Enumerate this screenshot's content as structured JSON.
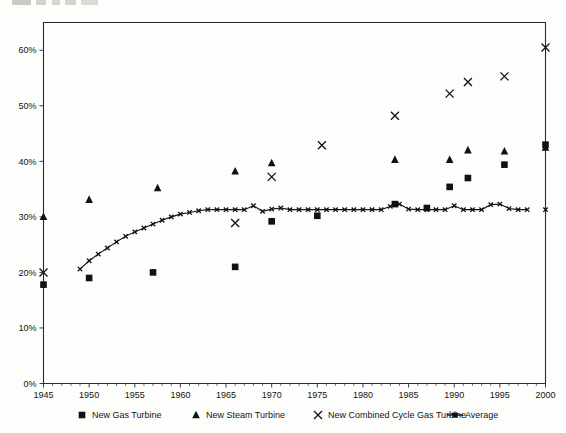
{
  "page": {
    "cut_off_header_fragment": "",
    "background_color": "#fdfdfb",
    "ink_color": "#111111"
  },
  "chart_data": {
    "type": "scatter",
    "title": "",
    "subtitle": "",
    "xlabel": "",
    "ylabel": "",
    "xlim": [
      1945,
      2000
    ],
    "ylim": [
      0,
      65
    ],
    "ytick_labels": [
      "0%",
      "10%",
      "20%",
      "30%",
      "40%",
      "50%",
      "60%"
    ],
    "ytick_values": [
      0,
      10,
      20,
      30,
      40,
      50,
      60
    ],
    "xtick_labels": [
      "1945",
      "1950",
      "1955",
      "1960",
      "1965",
      "1970",
      "1975",
      "1980",
      "1985",
      "1990",
      "1995",
      "2000"
    ],
    "xtick_values": [
      1945,
      1950,
      1955,
      1960,
      1965,
      1970,
      1975,
      1980,
      1985,
      1990,
      1995,
      2000
    ],
    "grid": false,
    "legend_position": "bottom",
    "y_unit": "percent",
    "series": [
      {
        "name": "New Gas Turbine",
        "marker": "square",
        "style": "points",
        "points": [
          [
            1945,
            17.8
          ],
          [
            1950,
            19.0
          ],
          [
            1957,
            20.0
          ],
          [
            1966,
            21.0
          ],
          [
            1970,
            29.2
          ],
          [
            1975,
            30.2
          ],
          [
            1983.5,
            32.3
          ],
          [
            1987,
            31.6
          ],
          [
            1989.5,
            35.4
          ],
          [
            1991.5,
            37.0
          ],
          [
            1995.5,
            39.4
          ],
          [
            2000,
            43.0
          ]
        ]
      },
      {
        "name": "New Steam Turbine",
        "marker": "triangle",
        "style": "points",
        "points": [
          [
            1945,
            30.0
          ],
          [
            1950,
            33.1
          ],
          [
            1957.5,
            35.2
          ],
          [
            1966,
            38.2
          ],
          [
            1970,
            39.7
          ],
          [
            1983.5,
            40.3
          ],
          [
            1989.5,
            40.3
          ],
          [
            1991.5,
            42.0
          ],
          [
            1995.5,
            41.8
          ],
          [
            2000,
            42.5
          ]
        ]
      },
      {
        "name": "New Combined Cycle Gas Turbine",
        "marker": "x",
        "style": "points",
        "points": [
          [
            1945,
            20.0
          ],
          [
            1966,
            28.9
          ],
          [
            1970,
            37.2
          ],
          [
            1975.5,
            42.9
          ],
          [
            1983.5,
            48.2
          ],
          [
            1989.5,
            52.2
          ],
          [
            1991.5,
            54.3
          ],
          [
            1995.5,
            55.3
          ],
          [
            2000,
            60.5
          ]
        ]
      },
      {
        "name": "Average",
        "marker": "x-line",
        "style": "line+points",
        "points": [
          [
            1949,
            20.6
          ],
          [
            1950,
            22.1
          ],
          [
            1951,
            23.3
          ],
          [
            1952,
            24.4
          ],
          [
            1953,
            25.5
          ],
          [
            1954,
            26.5
          ],
          [
            1955,
            27.3
          ],
          [
            1956,
            28.0
          ],
          [
            1957,
            28.7
          ],
          [
            1958,
            29.4
          ],
          [
            1959,
            30.0
          ],
          [
            1960,
            30.5
          ],
          [
            1961,
            30.8
          ],
          [
            1962,
            31.1
          ],
          [
            1963,
            31.3
          ],
          [
            1964,
            31.3
          ],
          [
            1965,
            31.3
          ],
          [
            1966,
            31.3
          ],
          [
            1967,
            31.3
          ],
          [
            1968,
            32.0
          ],
          [
            1969,
            31.0
          ],
          [
            1970,
            31.4
          ],
          [
            1971,
            31.6
          ],
          [
            1972,
            31.3
          ],
          [
            1973,
            31.3
          ],
          [
            1974,
            31.3
          ],
          [
            1975,
            31.3
          ],
          [
            1976,
            31.3
          ],
          [
            1977,
            31.3
          ],
          [
            1978,
            31.3
          ],
          [
            1979,
            31.3
          ],
          [
            1980,
            31.3
          ],
          [
            1981,
            31.3
          ],
          [
            1982,
            31.3
          ],
          [
            1983,
            31.9
          ],
          [
            1984,
            32.3
          ],
          [
            1985,
            31.4
          ],
          [
            1986,
            31.3
          ],
          [
            1987,
            31.3
          ],
          [
            1988,
            31.3
          ],
          [
            1989,
            31.3
          ],
          [
            1990,
            32.0
          ],
          [
            1991,
            31.3
          ],
          [
            1992,
            31.3
          ],
          [
            1993,
            31.3
          ],
          [
            1994,
            32.2
          ],
          [
            1995,
            32.3
          ],
          [
            1996,
            31.5
          ],
          [
            1997,
            31.3
          ],
          [
            1998,
            31.3
          ]
        ],
        "detached_points": [
          [
            2000,
            31.3
          ]
        ]
      }
    ]
  },
  "legend": {
    "items": [
      {
        "label": "New Gas Turbine",
        "marker": "square"
      },
      {
        "label": "New Steam Turbine",
        "marker": "triangle"
      },
      {
        "label": "New Combined Cycle Gas Turbine",
        "marker": "x"
      },
      {
        "label": "Average",
        "marker": "x-line"
      }
    ]
  }
}
